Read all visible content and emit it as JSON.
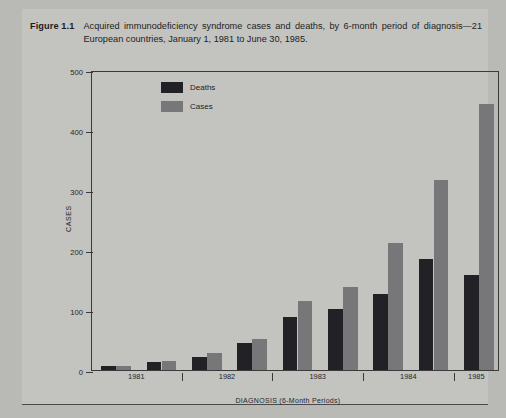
{
  "figure": {
    "label": "Figure 1.1",
    "caption": "Acquired immunodeficiency syndrome cases and deaths, by 6-month period of diagnosis—21 European countries, January 1, 1981 to June 30, 1985."
  },
  "colors": {
    "background": "#b9b9b6",
    "panel": "#c3c3c0",
    "deaths": "#222226",
    "cases": "#77777a",
    "axis": "#3a3a38",
    "text": "#26262a"
  },
  "legend": {
    "items": [
      {
        "label": "Deaths",
        "color": "#222226"
      },
      {
        "label": "Cases",
        "color": "#77777a"
      }
    ]
  },
  "chart_data": {
    "type": "bar",
    "title": "Acquired immunodeficiency syndrome cases and deaths, by 6-month period of diagnosis—21 European countries, January 1, 1981 to June 30, 1985.",
    "xlabel": "DIAGNOSIS (6-Month Periods)",
    "ylabel": "CASES",
    "ylim": [
      0,
      500
    ],
    "yticks": [
      0,
      100,
      200,
      300,
      400,
      500
    ],
    "ytick_labels": [
      "0",
      "100",
      "200",
      "300",
      "400",
      "500"
    ],
    "grid": false,
    "legend_position": "upper-left-inside",
    "x": [
      "1981 Jan-Jun",
      "1981 Jul-Dec",
      "1982 Jan-Jun",
      "1982 Jul-Dec",
      "1983 Jan-Jun",
      "1983 Jul-Dec",
      "1984 Jan-Jun",
      "1984 Jul-Dec",
      "1985 Jan-Jun"
    ],
    "year_labels": [
      "1981",
      "1982",
      "1983",
      "1984",
      "1985"
    ],
    "series": [
      {
        "name": "Deaths",
        "color": "#222226",
        "values": [
          6,
          14,
          22,
          45,
          88,
          102,
          127,
          185,
          158
        ]
      },
      {
        "name": "Cases",
        "color": "#77777a",
        "values": [
          7,
          15,
          28,
          52,
          115,
          138,
          212,
          317,
          443
        ]
      }
    ]
  }
}
